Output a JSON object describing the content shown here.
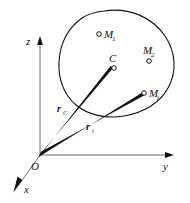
{
  "figure": {
    "kind": "mechanics-position-vector-diagram",
    "background_color": "#ffffff",
    "ink_color": "#111111",
    "axis_color": "#6b6b6b"
  },
  "axes": {
    "z": {
      "label": "z"
    },
    "y": {
      "label": "y"
    },
    "x": {
      "label": "x"
    },
    "origin": {
      "label": "O"
    }
  },
  "body": {
    "name": "rigid-body-outline",
    "stroke_color": "#111111"
  },
  "points": [
    {
      "id": "M1",
      "label": "M",
      "subscript": "1"
    },
    {
      "id": "M2",
      "label": "M",
      "subscript": "2"
    },
    {
      "id": "C",
      "label": "C",
      "subscript": ""
    },
    {
      "id": "Mi",
      "label": "M",
      "subscript": "i"
    }
  ],
  "vectors": [
    {
      "id": "rC",
      "label": "r",
      "subscript": "C",
      "from": "O",
      "to": "C"
    },
    {
      "id": "ri",
      "label": "r",
      "subscript": "i",
      "from": "O",
      "to": "Mi"
    }
  ]
}
